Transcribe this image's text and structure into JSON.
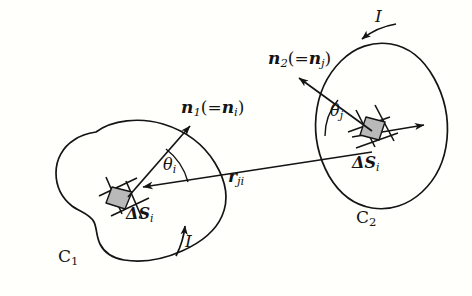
{
  "figure": {
    "domain": "diagram",
    "background_color": "#fffffc",
    "ink_color": "#141414",
    "patch_fill_color": "#b9b9b9"
  },
  "loops": [
    {
      "id": "loop-1",
      "curve_label": "C",
      "curve_subscript": "1",
      "current_label": "I",
      "current_direction": "counterclockwise",
      "patch_label_delta": "Δ",
      "patch_label_symbol": "S",
      "patch_label_subscript": "i",
      "normal_symbol": "n",
      "normal_subscript": "1",
      "normal_alias_symbol": "n",
      "normal_alias_subscript": "i",
      "angle_symbol": "θ",
      "angle_subscript": "i"
    },
    {
      "id": "loop-2",
      "curve_label": "C",
      "curve_subscript": "2",
      "current_label": "I",
      "current_direction": "clockwise",
      "patch_label_delta": "Δ",
      "patch_label_symbol": "S",
      "patch_label_subscript": "i",
      "normal_symbol": "n",
      "normal_subscript": "2",
      "normal_alias_symbol": "n",
      "normal_alias_subscript": "j",
      "angle_symbol": "θ",
      "angle_subscript": "j"
    }
  ],
  "separation_vector": {
    "symbol": "r",
    "subscript": "ji",
    "description": "vector from surface element on loop 2 to surface element on loop 1"
  },
  "parens": {
    "open": "(",
    "equals": "=",
    "close": ")"
  }
}
